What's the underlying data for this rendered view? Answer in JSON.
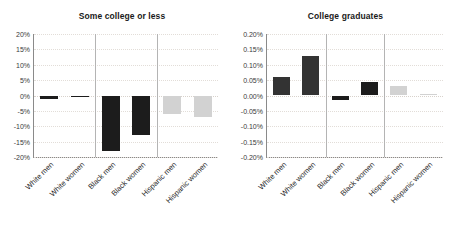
{
  "chart_data": [
    {
      "type": "bar",
      "title": "Some college or less",
      "xlabel": "",
      "ylabel": "",
      "categories": [
        "White men",
        "White women",
        "Black men",
        "Black women",
        "Hispanic men",
        "Hispanic women"
      ],
      "values": [
        -1.0,
        -0.5,
        -18.0,
        -13.0,
        -6.0,
        -7.0
      ],
      "bar_colors": [
        "#1c1c1c",
        "#1c1c1c",
        "#1c1c1c",
        "#1c1c1c",
        "#d2d2d2",
        "#d2d2d2"
      ],
      "ylim": [
        -20,
        20
      ],
      "yticks": [
        20,
        15,
        10,
        5,
        0,
        -5,
        -10,
        -15,
        -20
      ],
      "ytick_labels": [
        "20%",
        "15%",
        "10%",
        "5%",
        "0%",
        "-5%",
        "-10%",
        "-15%",
        "-20%"
      ],
      "grid": true,
      "legend": "none",
      "group_separators_after": [
        1,
        3
      ]
    },
    {
      "type": "bar",
      "title": "College graduates",
      "xlabel": "",
      "ylabel": "",
      "categories": [
        "White men",
        "White women",
        "Black men",
        "Black women",
        "Hispanic men",
        "Hispanic women"
      ],
      "values": [
        0.06,
        0.13,
        -0.015,
        0.045,
        0.03,
        0.005
      ],
      "bar_colors": [
        "#333333",
        "#333333",
        "#1c1c1c",
        "#1c1c1c",
        "#d2d2d2",
        "#d2d2d2"
      ],
      "ylim": [
        -0.2,
        0.2
      ],
      "yticks": [
        0.2,
        0.15,
        0.1,
        0.05,
        0.0,
        -0.05,
        -0.1,
        -0.15,
        -0.2
      ],
      "ytick_labels": [
        "0.20%",
        "0.15%",
        "0.10%",
        "0.05%",
        "0.00%",
        "-0.05%",
        "-0.10%",
        "-0.15%",
        "-0.20%"
      ],
      "grid": true,
      "legend": "none",
      "group_separators_after": [
        1,
        3
      ]
    }
  ],
  "figure": {
    "background": "#ffffff",
    "axis_color": "#8a8a8a",
    "grid_color": "#e2ddd8",
    "separator_color": "#b4b4b4",
    "dark_bar_color": "#1c1c1c",
    "light_bar_color": "#d2d2d2",
    "tick_label_color": "#3a3a3a",
    "title_color": "#1a1a1a"
  }
}
